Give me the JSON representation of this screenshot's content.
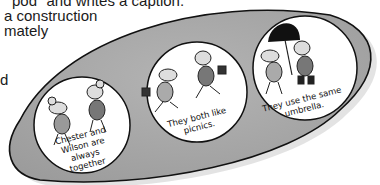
{
  "document": {
    "text_lines": [
      "pod\" and writes a caption.",
      "a construction",
      "mately",
      "d"
    ]
  },
  "illustration": {
    "description": "pea-pod shape containing three circles with mice",
    "pod_color": "#a8a8a8",
    "circles": [
      {
        "caption_lines": [
          "Chester and",
          "Wilson are always",
          "together"
        ]
      },
      {
        "caption_lines": [
          "They both like",
          "picnics."
        ]
      },
      {
        "caption_lines": [
          "They use the same",
          "umbrella."
        ]
      }
    ]
  }
}
